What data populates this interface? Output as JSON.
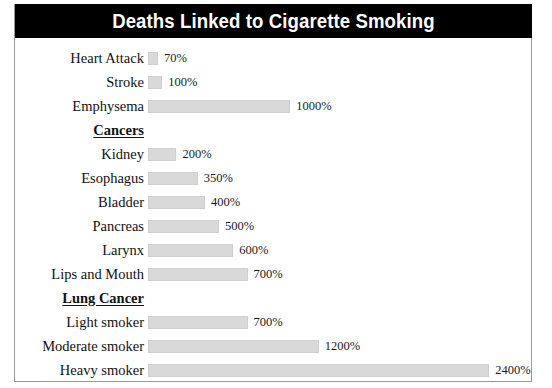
{
  "chart_data": {
    "type": "bar",
    "title": "Deaths Linked to Cigarette Smoking",
    "xlabel": "",
    "ylabel": "",
    "orientation": "horizontal",
    "grid": false,
    "legend": false,
    "value_suffix": "%",
    "xlim": [
      0,
      2400
    ],
    "categories": [
      "Heart Attack",
      "Stroke",
      "Emphysema",
      "Cancers",
      "Kidney",
      "Esophagus",
      "Bladder",
      "Pancreas",
      "Larynx",
      "Lips and Mouth",
      "Lung Cancer",
      "Light smoker",
      "Moderate smoker",
      "Heavy smoker"
    ],
    "values": [
      70,
      100,
      1000,
      null,
      200,
      350,
      400,
      500,
      600,
      700,
      null,
      700,
      1200,
      2400
    ],
    "rows": [
      {
        "label": "Heart Attack",
        "value": 70,
        "value_label": "70%",
        "section": false
      },
      {
        "label": "Stroke",
        "value": 100,
        "value_label": "100%",
        "section": false
      },
      {
        "label": "Emphysema",
        "value": 1000,
        "value_label": "1000%",
        "section": false
      },
      {
        "label": "Cancers",
        "value": null,
        "value_label": "",
        "section": true
      },
      {
        "label": "Kidney",
        "value": 200,
        "value_label": "200%",
        "section": false
      },
      {
        "label": "Esophagus",
        "value": 350,
        "value_label": "350%",
        "section": false
      },
      {
        "label": "Bladder",
        "value": 400,
        "value_label": "400%",
        "section": false
      },
      {
        "label": "Pancreas",
        "value": 500,
        "value_label": "500%",
        "section": false
      },
      {
        "label": "Larynx",
        "value": 600,
        "value_label": "600%",
        "section": false
      },
      {
        "label": "Lips and Mouth",
        "value": 700,
        "value_label": "700%",
        "section": false
      },
      {
        "label": "Lung Cancer",
        "value": null,
        "value_label": "",
        "section": true
      },
      {
        "label": "Light smoker",
        "value": 700,
        "value_label": "700%",
        "section": false
      },
      {
        "label": "Moderate smoker",
        "value": 1200,
        "value_label": "1200%",
        "section": false
      },
      {
        "label": "Heavy smoker",
        "value": 2400,
        "value_label": "2400%",
        "section": false
      }
    ],
    "colors": {
      "bar_fill": "#d9d9d9",
      "bar_edge": "#cfcfcf",
      "title_background": "#000000",
      "title_text": "#ffffff",
      "frame": "#9a9a9a",
      "background": "#ffffff",
      "text": "#121212"
    },
    "scale_px_per_percent": 0.1422
  }
}
